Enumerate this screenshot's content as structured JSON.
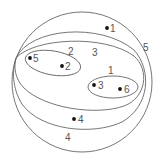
{
  "diagram": {
    "type": "nested-cluster-venn",
    "stroke_color": "#666666",
    "dot_color": "#111111",
    "clusters": [
      {
        "label": "5",
        "members": [
          "1",
          "2",
          "3",
          "4",
          "5",
          "6"
        ]
      },
      {
        "label": "4",
        "members": [
          "2",
          "3",
          "4",
          "5",
          "6"
        ]
      },
      {
        "label": "3",
        "members": [
          "2",
          "3",
          "5",
          "6"
        ]
      },
      {
        "label": "2",
        "members": [
          "5",
          "2"
        ]
      },
      {
        "label": "1",
        "members": [
          "3",
          "6"
        ]
      }
    ],
    "points": [
      {
        "label": "1"
      },
      {
        "label": "5"
      },
      {
        "label": "2"
      },
      {
        "label": "3"
      },
      {
        "label": "6"
      },
      {
        "label": "4"
      }
    ]
  }
}
